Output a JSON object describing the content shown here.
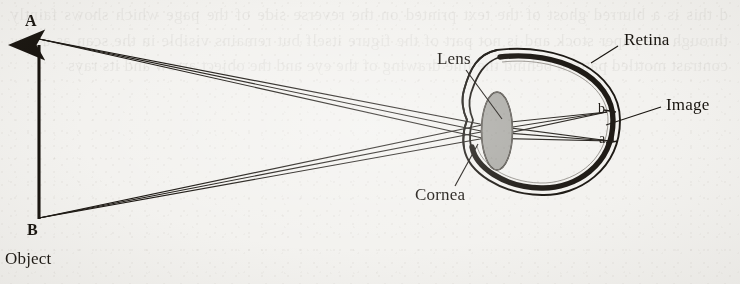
{
  "figure": {
    "type": "optics-ray-diagram",
    "background_color": "#f3f2ef",
    "ink_color": "#15110c"
  },
  "labels": {
    "object_top": "A",
    "object_bottom": "B",
    "object": "Object",
    "lens": "Lens",
    "cornea": "Cornea",
    "retina": "Retina",
    "image": "Image",
    "image_top": "b",
    "image_bottom": "a"
  },
  "bleed_through_text": "d this is a blurred ghost of the text printed on the reverse side of the page which shows faintly through the paper stock and is not part of the figure itself but remains visible in the scan as a low contrast mottled pattern behind the line drawing of the eye and the object arrow and its rays",
  "diagram_data": {
    "object": {
      "name": "Object",
      "shape": "upward-arrow",
      "top_point": {
        "label": "A",
        "x": 38,
        "y": 38
      },
      "bottom_point": {
        "label": "B",
        "x": 38,
        "y": 218
      },
      "orientation": "erect"
    },
    "eye": {
      "center": {
        "x": 549,
        "y": 120
      },
      "radius": 71,
      "layers": [
        "sclera",
        "retina"
      ],
      "cornea": {
        "description": "anterior bulge on the left of the globe"
      },
      "lens": {
        "center": {
          "x": 497,
          "y": 131
        },
        "rx": 15,
        "ry": 39,
        "fill": "#a9a8a3",
        "shape": "biconvex-ellipse"
      }
    },
    "image": {
      "name": "Image",
      "orientation": "inverted",
      "points": [
        {
          "label": "b",
          "from_object_point": "B",
          "x": 607,
          "y": 112
        },
        {
          "label": "a",
          "from_object_point": "A",
          "x": 610,
          "y": 141
        }
      ]
    },
    "ray_bundles": [
      {
        "from": "A",
        "to": "a",
        "ray_count": 3,
        "note": "rays from top of object converge at lower point a on retina"
      },
      {
        "from": "B",
        "to": "b",
        "ray_count": 3,
        "note": "rays from bottom of object converge at upper point b on retina"
      }
    ],
    "leader_lines": [
      {
        "label": "Lens",
        "from": {
          "x": 466,
          "y": 70
        },
        "to": {
          "x": 500,
          "y": 118
        }
      },
      {
        "label": "Cornea",
        "from": {
          "x": 455,
          "y": 186
        },
        "to": {
          "x": 478,
          "y": 146
        }
      },
      {
        "label": "Retina",
        "from": {
          "x": 618,
          "y": 45
        },
        "to": {
          "x": 592,
          "y": 62
        }
      },
      {
        "label": "Image",
        "from": {
          "x": 661,
          "y": 107
        },
        "to": {
          "x": 607,
          "y": 125
        }
      }
    ]
  }
}
